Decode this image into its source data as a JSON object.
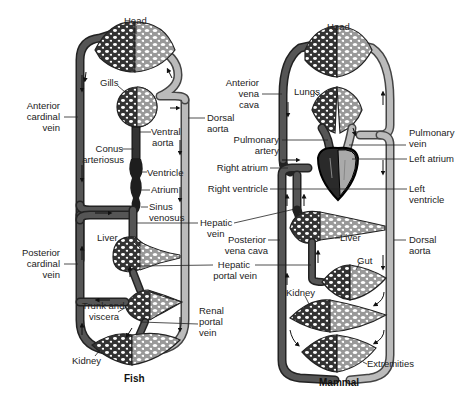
{
  "fish": {
    "caption": "Fish",
    "labels": {
      "head": "Head",
      "gills": "Gills",
      "anterior_cardinal_vein": [
        "Anterior",
        "cardinal",
        "vein"
      ],
      "dorsal_aorta": [
        "Dorsal",
        "aorta"
      ],
      "ventral_aorta": [
        "Ventral",
        "aorta"
      ],
      "conus_arteriosus": [
        "Conus",
        "arteriosus"
      ],
      "ventricle": "Ventricle",
      "atrium": "Atrium",
      "sinus_venosus": [
        "Sinus",
        "venosus"
      ],
      "hepatic_vein": [
        "Hepatic",
        "vein"
      ],
      "liver": "Liver",
      "posterior_cardinal_vein": [
        "Posterior",
        "cardinal",
        "vein"
      ],
      "hepatic_portal_vein": [
        "Hepatic",
        "portal vein"
      ],
      "trunk_and_viscera": [
        "Trunk and",
        "viscera"
      ],
      "renal_portal_vein": [
        "Renal",
        "portal",
        "vein"
      ],
      "kidney": "Kidney"
    }
  },
  "mammal": {
    "caption": "Mammal",
    "labels": {
      "head": "Head",
      "lungs": "Lungs",
      "anterior_vena_cava": [
        "Anterior",
        "vena",
        "cava"
      ],
      "pulmonary_artery": [
        "Pulmonary",
        "artery"
      ],
      "pulmonary_vein": [
        "Pulmonary",
        "vein"
      ],
      "right_atrium": "Right atrium",
      "left_atrium": "Left atrium",
      "right_ventricle": "Right ventricle",
      "left_ventricle": [
        "Left",
        "ventricle"
      ],
      "posterior_vena_cava": [
        "Posterior",
        "vena cava"
      ],
      "liver": "Liver",
      "dorsal_aorta": [
        "Dorsal",
        "aorta"
      ],
      "gut": "Gut",
      "kidney": "Kidney",
      "extremities": "Extremities"
    }
  },
  "colors": {
    "deoxygenated": "#555555",
    "oxygenated": "#bbbbbb",
    "heart": "#2a2a2a",
    "background": "#ffffff"
  }
}
